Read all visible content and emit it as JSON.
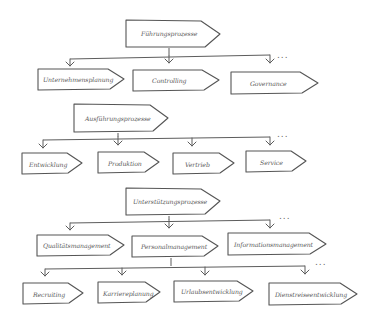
{
  "diagram": {
    "type": "process-hierarchy",
    "style": "hand-drawn",
    "colors": {
      "stroke": "#555555",
      "text": "#5a5a5a",
      "background": "#ffffff"
    },
    "continuation_marker": "...",
    "groups": [
      {
        "label": "Führungsprozesse",
        "children": [
          {
            "label": "Unternehmensplanung"
          },
          {
            "label": "Controlling"
          },
          {
            "label": "Governance"
          }
        ],
        "has_more": true
      },
      {
        "label": "Ausführungsprozesse",
        "children": [
          {
            "label": "Entwicklung"
          },
          {
            "label": "Produktion"
          },
          {
            "label": "Vertrieb"
          },
          {
            "label": "Service"
          }
        ],
        "has_more": true
      },
      {
        "label": "Unterstützungsprozesse",
        "children": [
          {
            "label": "Qualitätsmanagement"
          },
          {
            "label": "Personalmanagement",
            "children": [
              {
                "label": "Recruiting"
              },
              {
                "label": "Karriereplanung"
              },
              {
                "label": "Urlaubsentwicklung"
              },
              {
                "label": "Dienstreiseentwicklung"
              }
            ],
            "has_more": true
          },
          {
            "label": "Informationsmanagement"
          }
        ],
        "has_more": true
      }
    ]
  }
}
